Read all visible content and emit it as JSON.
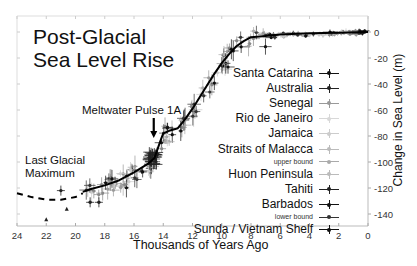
{
  "chart_data": {
    "type": "line",
    "title": "Post-Glacial Sea Level Rise",
    "xlabel": "Thousands of Years Ago",
    "ylabel": "Change in Sea Level (m)",
    "xlim": [
      24,
      0
    ],
    "ylim": [
      -150,
      5
    ],
    "x_ticks": [
      24,
      22,
      20,
      18,
      16,
      14,
      12,
      10,
      8,
      6,
      4,
      2,
      0
    ],
    "y_ticks": [
      0,
      -20,
      -40,
      -60,
      -80,
      -100,
      -120,
      -140
    ],
    "grid": false,
    "legend_position": "right-center",
    "annotations": [
      {
        "text": "Meltwater Pulse 1A",
        "x": 14.6,
        "y": -96
      },
      {
        "text": "Last Glacial Maximum",
        "x": 21,
        "y": -105
      }
    ],
    "series": [
      {
        "name": "Reconstructed curve (dashed, extrapolated)",
        "style": "dashed",
        "x": [
          24,
          23,
          22,
          21,
          20,
          19.5
        ],
        "y": [
          -124,
          -127,
          -129,
          -129,
          -127,
          -124
        ]
      },
      {
        "name": "Reconstructed curve",
        "style": "solid",
        "x": [
          19.5,
          19,
          18,
          17,
          16,
          15,
          14.6,
          14.2,
          14,
          13.6,
          13,
          12.5,
          12,
          11.5,
          11,
          10.5,
          10,
          9.5,
          9,
          8.5,
          8,
          7,
          6,
          4,
          2,
          0
        ],
        "y": [
          -123,
          -121,
          -118,
          -114,
          -108,
          -101,
          -97,
          -84,
          -78,
          -76,
          -74,
          -67,
          -59,
          -50,
          -41,
          -32,
          -24,
          -17,
          -11,
          -7,
          -4,
          -3,
          -2,
          -1,
          -0.5,
          0
        ]
      }
    ],
    "legend": [
      {
        "label": "Santa Catarina",
        "color": "#111111"
      },
      {
        "label": "Australia",
        "color": "#222222"
      },
      {
        "label": "Senegal",
        "color": "#999999"
      },
      {
        "label": "Rio de Janeiro",
        "color": "#d8d8d8"
      },
      {
        "label": "Jamaica",
        "color": "#cccccc"
      },
      {
        "label": "Straits of Malacca",
        "color": "#bbbbbb"
      },
      {
        "label": "upper bound",
        "color": "#aaaaaa",
        "small": true
      },
      {
        "label": "Huon Peninsula",
        "color": "#bbbbbb"
      },
      {
        "label": "Tahiti",
        "color": "#222222"
      },
      {
        "label": "Barbados",
        "color": "#111111"
      },
      {
        "label": "lower bound",
        "color": "#333333",
        "small": true
      },
      {
        "label": "Sunda / Vietnam Shelf",
        "color": "#111111"
      }
    ]
  },
  "labels": {
    "title": "Post-Glacial\nSea Level Rise",
    "meltwater": "Meltwater Pulse 1A",
    "lgm_line1": "Last Glacial",
    "lgm_line2": "Maximum",
    "xlabel": "Thousands of Years Ago",
    "ylabel": "Change in Sea Level (m)"
  }
}
